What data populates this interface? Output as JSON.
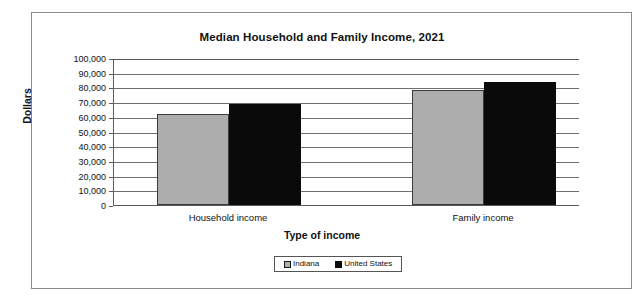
{
  "chart_data": {
    "type": "bar",
    "title": "Median Household and Family Income, 2021",
    "xlabel": "Type of income",
    "ylabel": "Dollars",
    "categories": [
      "Household income",
      "Family income"
    ],
    "series": [
      {
        "name": "Indiana",
        "color": "#adadad",
        "values": [
          62000,
          78000
        ]
      },
      {
        "name": "United States",
        "color": "#0a0a0a",
        "values": [
          69000,
          84000
        ]
      }
    ],
    "ylim": [
      0,
      100000
    ],
    "ytick_values": [
      100000,
      90000,
      80000,
      70000,
      60000,
      50000,
      40000,
      30000,
      20000,
      10000,
      0
    ],
    "ytick_labels": [
      "100,000",
      "90,000",
      "80,000",
      "70,000",
      "60,000",
      "50,000",
      "40,000",
      "30,000",
      "20,000",
      "10,000",
      "0"
    ],
    "grid": true,
    "legend_position": "bottom"
  },
  "legend": {
    "items": [
      {
        "label": "Indiana"
      },
      {
        "label": "United States"
      }
    ]
  }
}
